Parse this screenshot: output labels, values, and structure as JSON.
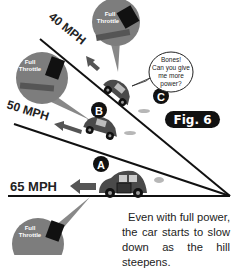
{
  "figure": {
    "label": "Fig. 6",
    "caption_lines": [
      "Even with full power,",
      "the car starts to slow",
      "down as the hill steepens."
    ]
  },
  "slopes": [
    {
      "id": "A",
      "speed": "65 MPH",
      "throttle": "Full Throttle"
    },
    {
      "id": "B",
      "speed": "50 MPH",
      "throttle": "Full Throttle"
    },
    {
      "id": "C",
      "speed": "40 MPH",
      "throttle": "Full Throttle"
    }
  ],
  "speech_bubble": [
    "Bones!",
    "Can you give",
    "me more",
    "power?"
  ],
  "colors": {
    "car": "#4a4a4a",
    "badge_bg": "#111111",
    "bubble_circle": "#7d7d7d",
    "line": "#111111"
  }
}
